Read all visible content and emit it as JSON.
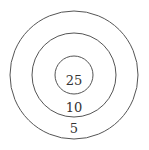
{
  "diagram": {
    "type": "concentric-circles-target",
    "rings": [
      {
        "label": "25",
        "radius": 19
      },
      {
        "label": "10",
        "radius": 42
      },
      {
        "label": "5",
        "radius": 64
      }
    ],
    "stroke_color": "#555555"
  }
}
